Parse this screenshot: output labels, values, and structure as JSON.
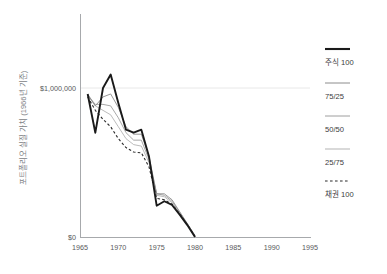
{
  "axis": {
    "y_title": "포트폴리오 실질 가치 (1966년 기준)",
    "y_ticks": [
      "$1,000,000",
      "$0"
    ],
    "x_ticks": [
      "1965",
      "1970",
      "1975",
      "1980",
      "1985",
      "1990",
      "1995"
    ]
  },
  "legend": {
    "items": [
      {
        "label": "주식 100",
        "style": "solid-thick",
        "color": "#1a1a1a"
      },
      {
        "label": "75/25",
        "style": "solid-thin",
        "color": "#8c8c8c"
      },
      {
        "label": "50/50",
        "style": "solid-thin",
        "color": "#9e9e9e"
      },
      {
        "label": "25/75",
        "style": "solid-thin",
        "color": "#b3b3b3"
      },
      {
        "label": "채권 100",
        "style": "dashed",
        "color": "#2b2b2b"
      }
    ]
  },
  "chart_data": {
    "type": "line",
    "title": "",
    "xlabel": "",
    "ylabel": "포트폴리오 실질 가치 (1966년 기준)",
    "xlim": [
      1965,
      1995
    ],
    "ylim": [
      0,
      1150000
    ],
    "xticks": [
      1965,
      1970,
      1975,
      1980,
      1985,
      1990,
      1995
    ],
    "yticks": [
      0,
      1000000
    ],
    "ytick_labels": [
      "$0",
      "$1,000,000"
    ],
    "grid": "horizontal-at-1000000",
    "legend_position": "right",
    "x": [
      1966,
      1967,
      1968,
      1969,
      1970,
      1971,
      1972,
      1973,
      1974,
      1975,
      1976,
      1977,
      1978,
      1979,
      1980
    ],
    "series": [
      {
        "name": "주식 100",
        "style": "solid-thick",
        "color": "#1a1a1a",
        "values": [
          960000,
          700000,
          1000000,
          1090000,
          900000,
          720000,
          700000,
          720000,
          540000,
          210000,
          240000,
          215000,
          150000,
          80000,
          0
        ]
      },
      {
        "name": "75/25",
        "style": "solid-thin",
        "color": "#8c8c8c",
        "values": [
          960000,
          880000,
          940000,
          960000,
          870000,
          740000,
          690000,
          690000,
          540000,
          290000,
          290000,
          250000,
          170000,
          90000,
          10000
        ]
      },
      {
        "name": "50/50",
        "style": "solid-thin",
        "color": "#9e9e9e",
        "values": [
          950000,
          890000,
          890000,
          880000,
          800000,
          700000,
          650000,
          650000,
          520000,
          290000,
          280000,
          240000,
          165000,
          88000,
          8000
        ]
      },
      {
        "name": "25/75",
        "style": "solid-thin",
        "color": "#b3b3b3",
        "values": [
          950000,
          880000,
          850000,
          820000,
          740000,
          660000,
          620000,
          610000,
          500000,
          280000,
          270000,
          230000,
          160000,
          85000,
          5000
        ]
      },
      {
        "name": "채권 100",
        "style": "dashed",
        "color": "#2b2b2b",
        "values": [
          940000,
          850000,
          790000,
          740000,
          660000,
          600000,
          570000,
          565000,
          470000,
          260000,
          250000,
          220000,
          155000,
          82000,
          3000
        ]
      }
    ]
  }
}
